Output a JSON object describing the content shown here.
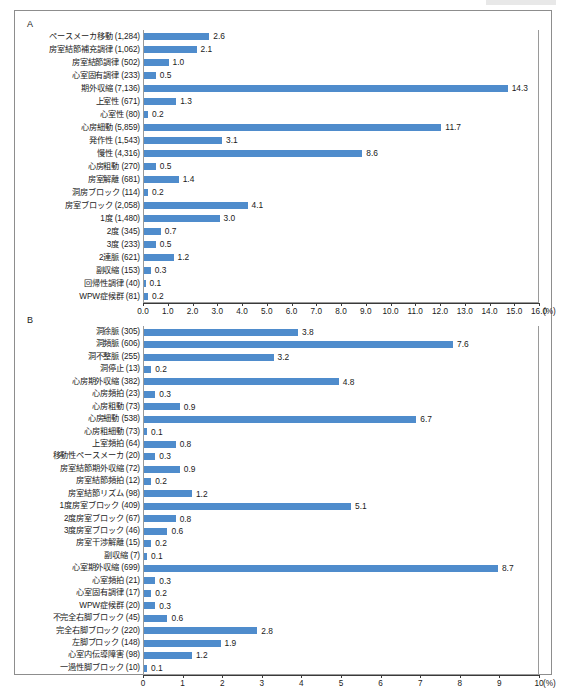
{
  "figure": {
    "caption": "",
    "bar_color": "#4f8ccc",
    "frame_color": "#8d8d8d"
  },
  "chart_data": [
    {
      "type": "bar",
      "id": "panel-a",
      "panel_label": "A",
      "orientation": "horizontal",
      "title": "",
      "xlabel": "(%)",
      "ylabel": "",
      "unit": "(%)",
      "xlim": [
        0.0,
        16.0
      ],
      "grid": false,
      "tick_labels": [
        "0.0",
        "1.0",
        "2.0",
        "3.0",
        "4.0",
        "5.0",
        "6.0",
        "7.0",
        "8.0",
        "9.0",
        "10.0",
        "11.0",
        "12.0",
        "13.0",
        "14.0",
        "15.0",
        "16.0"
      ],
      "ticks": [
        0,
        1,
        2,
        3,
        4,
        5,
        6,
        7,
        8,
        9,
        10,
        11,
        12,
        13,
        14,
        15,
        16
      ],
      "categories": [
        "ペースメーカ移動 (1,284)",
        "房室結節補充調律 (1,062)",
        "房室結節調律 (502)",
        "心室固有調律 (233)",
        "期外収縮 (7,136)",
        "上室性 (671)",
        "心室性 (80)",
        "心房細動 (5,859)",
        "発作性 (1,543)",
        "慢性 (4,316)",
        "心房粗動 (270)",
        "房室解離 (681)",
        "洞房ブロック (114)",
        "房室ブロック (2,058)",
        "1度 (1,480)",
        "2度 (345)",
        "3度 (233)",
        "2連脈 (621)",
        "副収縮 (153)",
        "回帰性調律 (40)",
        "WPW症候群 (81)"
      ],
      "counts": [
        1284,
        1062,
        502,
        233,
        7136,
        671,
        80,
        5859,
        1543,
        4316,
        270,
        681,
        114,
        2058,
        1480,
        345,
        233,
        621,
        153,
        40,
        81
      ],
      "values": [
        2.6,
        2.1,
        1.0,
        0.5,
        14.3,
        1.3,
        0.2,
        11.7,
        3.1,
        8.6,
        0.5,
        1.4,
        0.2,
        4.1,
        3.0,
        0.7,
        0.5,
        1.2,
        0.3,
        0.1,
        0.2
      ],
      "value_labels": [
        "2.6",
        "2.1",
        "1.0",
        "0.5",
        "14.3",
        "1.3",
        "0.2",
        "11.7",
        "3.1",
        "8.6",
        "0.5",
        "1.4",
        "0.2",
        "4.1",
        "3.0",
        "0.7",
        "0.5",
        "1.2",
        "0.3",
        "0.1",
        "0.2"
      ]
    },
    {
      "type": "bar",
      "id": "panel-b",
      "panel_label": "B",
      "orientation": "horizontal",
      "title": "",
      "xlabel": "(%)",
      "ylabel": "",
      "unit": "(%)",
      "xlim": [
        0,
        10
      ],
      "grid": false,
      "tick_labels": [
        "0",
        "1",
        "2",
        "3",
        "4",
        "5",
        "6",
        "7",
        "8",
        "9",
        "10"
      ],
      "ticks": [
        0,
        1,
        2,
        3,
        4,
        5,
        6,
        7,
        8,
        9,
        10
      ],
      "categories": [
        "洞徐脈 (305)",
        "洞頻脈 (606)",
        "洞不整脈 (255)",
        "洞停止 (13)",
        "心房期外収縮 (382)",
        "心房頻拍 (23)",
        "心房粗動 (73)",
        "心房細動 (538)",
        "心房粗細動 (73)",
        "上室頻拍 (64)",
        "移動性ペースメーカ (20)",
        "房室結節期外収縮 (72)",
        "房室結節頻拍 (12)",
        "房室結節リズム (98)",
        "1度房室ブロック (409)",
        "2度房室ブロック (67)",
        "3度房室ブロック (46)",
        "房室干渉解離 (15)",
        "副収縮 (7)",
        "心室期外収縮 (699)",
        "心室頻拍 (21)",
        "心室固有調律 (17)",
        "WPW症候群 (20)",
        "不完全右脚ブロック (45)",
        "完全右脚ブロック (220)",
        "左脚ブロック (148)",
        "心室内伝導障害 (98)",
        "一過性脚ブロック (10)"
      ],
      "counts": [
        305,
        606,
        255,
        13,
        382,
        23,
        73,
        538,
        73,
        64,
        20,
        72,
        12,
        98,
        409,
        67,
        46,
        15,
        7,
        699,
        21,
        17,
        20,
        45,
        220,
        148,
        98,
        10
      ],
      "values": [
        3.8,
        7.6,
        3.2,
        0.2,
        4.8,
        0.3,
        0.9,
        6.7,
        0.1,
        0.8,
        0.3,
        0.9,
        0.2,
        1.2,
        5.1,
        0.8,
        0.6,
        0.2,
        0.1,
        8.7,
        0.3,
        0.2,
        0.3,
        0.6,
        2.8,
        1.9,
        1.2,
        0.1
      ],
      "value_labels": [
        "3.8",
        "7.6",
        "3.2",
        "0.2",
        "4.8",
        "0.3",
        "0.9",
        "6.7",
        "0.1",
        "0.8",
        "0.3",
        "0.9",
        "0.2",
        "1.2",
        "5.1",
        "0.8",
        "0.6",
        "0.2",
        "0.1",
        "8.7",
        "0.3",
        "0.2",
        "0.3",
        "0.6",
        "2.8",
        "1.9",
        "1.2",
        "0.1"
      ]
    }
  ]
}
